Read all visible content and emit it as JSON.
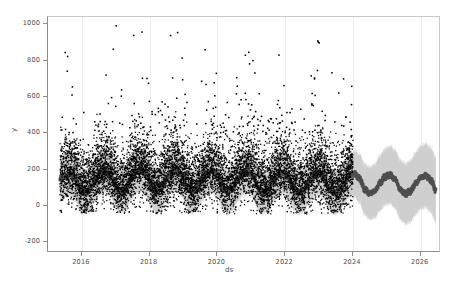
{
  "chart_data": {
    "type": "line",
    "title": "",
    "xlabel": "ds",
    "ylabel": "y",
    "ylim": [
      -260,
      1040
    ],
    "xlim": [
      2015.0,
      2026.6
    ],
    "grid": true,
    "legend": null,
    "yticks": [
      -200,
      0,
      200,
      400,
      600,
      800,
      1000
    ],
    "ytick_labels": [
      "-200",
      "0",
      "200",
      "400",
      "600",
      "800",
      "1000"
    ],
    "xticks": [
      2016,
      2018,
      2020,
      2022,
      2024,
      2026
    ],
    "xtick_labels": [
      "2016",
      "2018",
      "2020",
      "2022",
      "2024",
      "2026"
    ],
    "history_range": [
      2015.35,
      2024.0
    ],
    "forecast_range": [
      2024.0,
      2026.45
    ],
    "colors": {
      "observations": "#000000",
      "forecast_line": "#4d4d4d",
      "uncertainty_band": "#cfcfcf",
      "axis": "#8c8c8c",
      "grid": "#ececec",
      "text": "#4d4d4d",
      "background": "#ffffff"
    },
    "series": [
      {
        "name": "yhat",
        "role": "forecast-line",
        "description": "Prophet forecast trend with strong yearly seasonality, baseline slowly declining from ~130 to ~85",
        "x": [
          2015.35,
          2015.5,
          2015.65,
          2015.8,
          2015.95,
          2016.1,
          2016.25,
          2016.4,
          2016.55,
          2016.7,
          2016.85,
          2017.0,
          2017.15,
          2017.3,
          2017.45,
          2017.6,
          2017.75,
          2017.9,
          2018.05,
          2018.2,
          2018.35,
          2018.5,
          2018.65,
          2018.8,
          2018.95,
          2019.1,
          2019.25,
          2019.4,
          2019.55,
          2019.7,
          2019.85,
          2020.0,
          2020.15,
          2020.3,
          2020.45,
          2020.6,
          2020.75,
          2020.9,
          2021.05,
          2021.2,
          2021.35,
          2021.5,
          2021.65,
          2021.8,
          2021.95,
          2022.1,
          2022.25,
          2022.4,
          2022.55,
          2022.7,
          2022.85,
          2023.0,
          2023.15,
          2023.3,
          2023.45,
          2023.6,
          2023.75,
          2023.9,
          2024.05,
          2024.2,
          2024.35,
          2024.5,
          2024.65,
          2024.8,
          2024.95,
          2025.1,
          2025.25,
          2025.4,
          2025.55,
          2025.7,
          2025.85,
          2026.0,
          2026.15,
          2026.3,
          2026.45
        ],
        "values": [
          150,
          165,
          175,
          150,
          90,
          75,
          95,
          150,
          185,
          195,
          170,
          105,
          80,
          95,
          150,
          190,
          200,
          175,
          110,
          80,
          95,
          150,
          185,
          195,
          170,
          105,
          78,
          92,
          145,
          182,
          192,
          168,
          102,
          76,
          90,
          142,
          178,
          188,
          164,
          100,
          74,
          88,
          138,
          174,
          184,
          160,
          96,
          72,
          86,
          134,
          170,
          180,
          156,
          94,
          70,
          84,
          130,
          166,
          176,
          150,
          90,
          68,
          82,
          126,
          160,
          170,
          146,
          88,
          66,
          80,
          122,
          156,
          166,
          142,
          86
        ]
      },
      {
        "name": "yhat_lower",
        "role": "uncertainty-lower",
        "description": "Lower bound of 80% prediction interval, roughly yhat minus 120 in history, widening to yhat minus 175 at the forecast horizon"
      },
      {
        "name": "yhat_upper",
        "role": "uncertainty-upper",
        "description": "Upper bound of 80% prediction interval, roughly yhat plus 120 in history, widening to yhat plus 175 at the forecast horizon"
      },
      {
        "name": "y",
        "role": "observations",
        "description": "Dense black scatter of daily observations from mid-2015 through early 2024, bulk between 0 and 350 with heavy-tailed spikes reaching 600-980 during seasonal peaks",
        "bulk_range": [
          0,
          350
        ],
        "spike_max": 980,
        "n_visible_peaks": 9
      }
    ],
    "annotations": []
  },
  "axes": {
    "ylabel": "y",
    "xlabel": "ds"
  }
}
